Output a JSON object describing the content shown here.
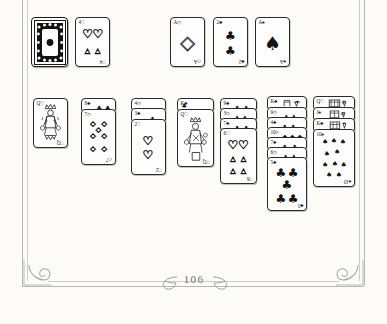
{
  "page": {
    "folio": "106",
    "background_color": "#fcfbf8",
    "ink_color": "#24231f",
    "frame_color": "#b9b7b2",
    "ornament_left": "scroll-spiral-ornament",
    "ornament_right": "scroll-spiral-ornament",
    "leaf_left": "leaf-flourish",
    "leaf_right": "leaf-flourish"
  },
  "illustration": {
    "title": "Klondike solitaire layout",
    "style": "hand-drawn pen sketch",
    "suit_glyphs": {
      "hearts": "♡",
      "diamonds": "◇",
      "clubs": "♣",
      "spades": "♠"
    },
    "stock": {
      "label": "stock-pile-face-down",
      "pattern": "ornate-card-back"
    },
    "waste": {
      "rank": "4",
      "suit": "hearts",
      "corner": "4♡",
      "corner_bottom": "♡4",
      "pip_count": 4
    },
    "foundations": [
      {
        "rank": "A",
        "suit": "diamonds",
        "corner": "A◇",
        "corner_bottom": "◇A",
        "pip_count": 1
      },
      {
        "rank": "2",
        "suit": "clubs",
        "corner": "2♣",
        "corner_bottom": "♣2",
        "pip_count": 2
      },
      {
        "rank": "A",
        "suit": "spades",
        "corner": "A♠",
        "corner_bottom": "♠A",
        "pip_count": 1
      }
    ],
    "tableau": [
      {
        "column": 1,
        "hidden_strips": [],
        "top_card": {
          "rank": "Q",
          "suit": "hearts",
          "corner": "Q♡",
          "corner_bottom": "♡Q",
          "face": "court"
        }
      },
      {
        "column": 2,
        "hidden_strips": [
          {
            "rank": "8",
            "suit": "clubs",
            "corner": "8♣"
          }
        ],
        "top_card": {
          "rank": "7",
          "suit": "diamonds",
          "corner": "7◇",
          "corner_bottom": "◇7",
          "pip_count": 7
        }
      },
      {
        "column": 3,
        "hidden_strips": [
          {
            "rank": "4",
            "suit": "diamonds",
            "corner": "4◇"
          },
          {
            "rank": "3",
            "suit": "clubs",
            "corner": "3♣"
          }
        ],
        "top_card": {
          "rank": "2",
          "suit": "hearts",
          "corner": "2♡",
          "corner_bottom": "♡2",
          "pip_count": 2
        }
      },
      {
        "column": 4,
        "hidden_strips": [
          {
            "rank": "K",
            "suit": "clubs",
            "corner": "K♣"
          }
        ],
        "top_card": {
          "rank": "Q",
          "suit": "hearts",
          "corner": "Q♡",
          "corner_bottom": "♡Q",
          "face": "court"
        }
      },
      {
        "column": 5,
        "hidden_strips": [
          {
            "rank": "9",
            "suit": "clubs",
            "corner": "9♣"
          },
          {
            "rank": "3",
            "suit": "diamonds",
            "corner": "3◇"
          },
          {
            "rank": "7",
            "suit": "clubs",
            "corner": "7♣"
          }
        ],
        "top_card": {
          "rank": "6",
          "suit": "hearts",
          "corner": "6♡",
          "corner_bottom": "♡6",
          "pip_count": 6
        }
      },
      {
        "column": 6,
        "hidden_strips": [
          {
            "rank": "K",
            "suit": "clubs",
            "corner": "K♣",
            "face": "court"
          },
          {
            "rank": "9",
            "suit": "diamonds",
            "corner": "9◇"
          },
          {
            "rank": "4",
            "suit": "clubs",
            "corner": "4♣"
          },
          {
            "rank": "10",
            "suit": "diamonds",
            "corner": "10◇"
          },
          {
            "rank": "7",
            "suit": "clubs",
            "corner": "7♣"
          },
          {
            "rank": "6",
            "suit": "diamonds",
            "corner": "6◇"
          }
        ],
        "top_card": {
          "rank": "5",
          "suit": "clubs",
          "corner": "5♣",
          "corner_bottom": "♣5",
          "pip_count": 5
        }
      },
      {
        "column": 7,
        "hidden_strips": [
          {
            "rank": "Q",
            "suit": "hearts",
            "corner": "Q♡",
            "face": "court"
          },
          {
            "rank": "J",
            "suit": "spades",
            "corner": "J♠",
            "face": "court"
          },
          {
            "rank": "K",
            "suit": "clubs",
            "corner": "K♣",
            "face": "court"
          }
        ],
        "top_card": {
          "rank": "10",
          "suit": "spades",
          "corner": "10♠",
          "corner_bottom": "♠10",
          "pip_count": 10
        }
      }
    ]
  }
}
